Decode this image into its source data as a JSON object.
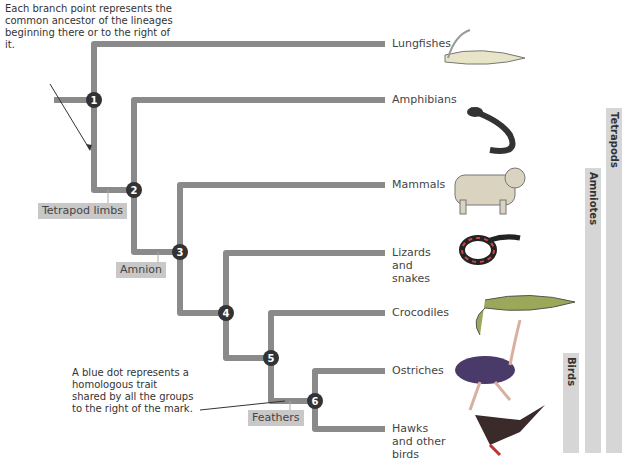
{
  "annotations": {
    "branch_point_note": "Each branch point represents the common ancestor of the lineages beginning there or to the right of it.",
    "blue_dot_note": "A blue dot represents a homologous trait shared by all the groups to the right of the mark."
  },
  "nodes": [
    "1",
    "2",
    "3",
    "4",
    "5",
    "6"
  ],
  "taxa": [
    {
      "label": "Lungfishes",
      "icon": "lungfish-illustration"
    },
    {
      "label": "Amphibians",
      "icon": "salamander-illustration"
    },
    {
      "label": "Mammals",
      "icon": "bobcat-illustration"
    },
    {
      "label": "Lizards and snakes",
      "icon": "snake-illustration"
    },
    {
      "label": "Crocodiles",
      "icon": "crocodile-illustration"
    },
    {
      "label": "Ostriches",
      "icon": "ostrich-illustration"
    },
    {
      "label": "Hawks and other birds",
      "icon": "hawk-illustration"
    }
  ],
  "traits": [
    {
      "label": "Tetrapod limbs"
    },
    {
      "label": "Amnion"
    },
    {
      "label": "Feathers"
    }
  ],
  "clades": [
    {
      "label": "Tetrapods"
    },
    {
      "label": "Amniotes"
    },
    {
      "label": "Birds"
    }
  ],
  "colors": {
    "branch": "#8a8a8a",
    "node": "#333333",
    "trait_box": "#c8c8c8",
    "clade_bar": "#d6d6d6"
  }
}
